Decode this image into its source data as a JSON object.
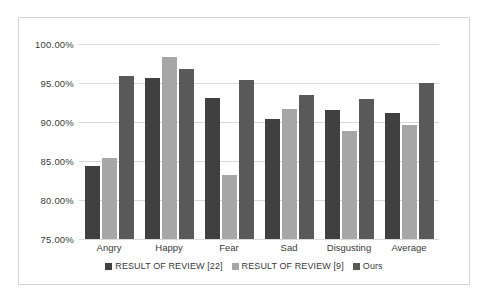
{
  "chart_data": {
    "type": "bar",
    "title": "",
    "subtitle": "",
    "xlabel": "",
    "ylabel": "",
    "categories": [
      "Angry",
      "Happy",
      "Fear",
      "Sad",
      "Disgusting",
      "Average"
    ],
    "series": [
      {
        "name": "RESULT OF REVIEW [22]",
        "color": "#404040",
        "values": [
          84.3,
          95.6,
          93.1,
          90.4,
          91.6,
          91.1
        ]
      },
      {
        "name": "RESULT OF REVIEW [9]",
        "color": "#a6a6a6",
        "values": [
          85.4,
          98.3,
          83.2,
          91.7,
          88.9,
          89.6
        ]
      },
      {
        "name": "Ours",
        "color": "#595959",
        "values": [
          95.9,
          96.8,
          95.4,
          93.5,
          92.9,
          95.0
        ]
      }
    ],
    "ylim": [
      75.0,
      100.0
    ],
    "ytick_values": [
      75.0,
      80.0,
      85.0,
      90.0,
      95.0,
      100.0
    ],
    "ytick_labels": [
      "75.00%",
      "80.00%",
      "85.00%",
      "90.00%",
      "95.00%",
      "100.00%"
    ],
    "grid": true,
    "grid_color": "#d9d9d9",
    "legend_position": "bottom",
    "plot_background": "#ffffff",
    "border_color": "#d4d4d4"
  }
}
